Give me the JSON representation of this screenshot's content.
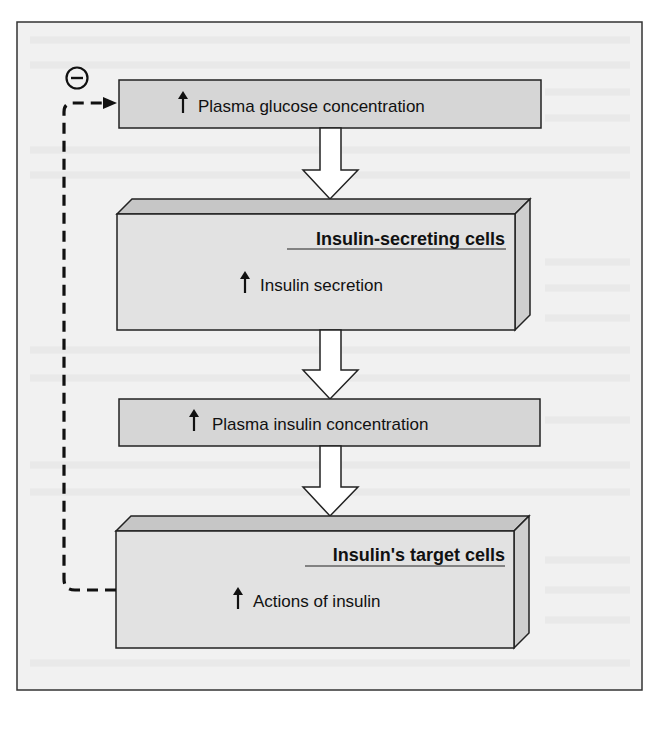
{
  "diagram": {
    "type": "flowchart-feedback-loop",
    "colors": {
      "frame_bg": "#f1f1f1",
      "frame_border": "#333333",
      "box_fill": "#d6d6d6",
      "box3d_front": "#e2e2e2",
      "box3d_top": "#c6c6c6",
      "box3d_side": "#cfcfcf",
      "arrow_fill": "#ffffff",
      "stroke": "#222222",
      "text": "#111111"
    },
    "nodes": [
      {
        "id": "n1",
        "kind": "flat",
        "symbol": "↑",
        "label": "Plasma glucose concentration"
      },
      {
        "id": "n2",
        "kind": "3d",
        "title": "Insulin-secreting cells",
        "symbol": "↑",
        "label": "Insulin secretion"
      },
      {
        "id": "n3",
        "kind": "flat",
        "symbol": "↑",
        "label": "Plasma insulin concentration"
      },
      {
        "id": "n4",
        "kind": "3d",
        "title": "Insulin's target cells",
        "symbol": "↑",
        "label": "Actions of insulin"
      }
    ],
    "edges": [
      {
        "from": "n1",
        "to": "n2",
        "style": "block-arrow"
      },
      {
        "from": "n2",
        "to": "n3",
        "style": "block-arrow"
      },
      {
        "from": "n3",
        "to": "n4",
        "style": "block-arrow"
      },
      {
        "from": "n4",
        "to": "n1",
        "style": "dashed",
        "sign": "⊖",
        "meaning": "negative feedback"
      }
    ],
    "feedback": {
      "sign_symbol": "−"
    }
  }
}
